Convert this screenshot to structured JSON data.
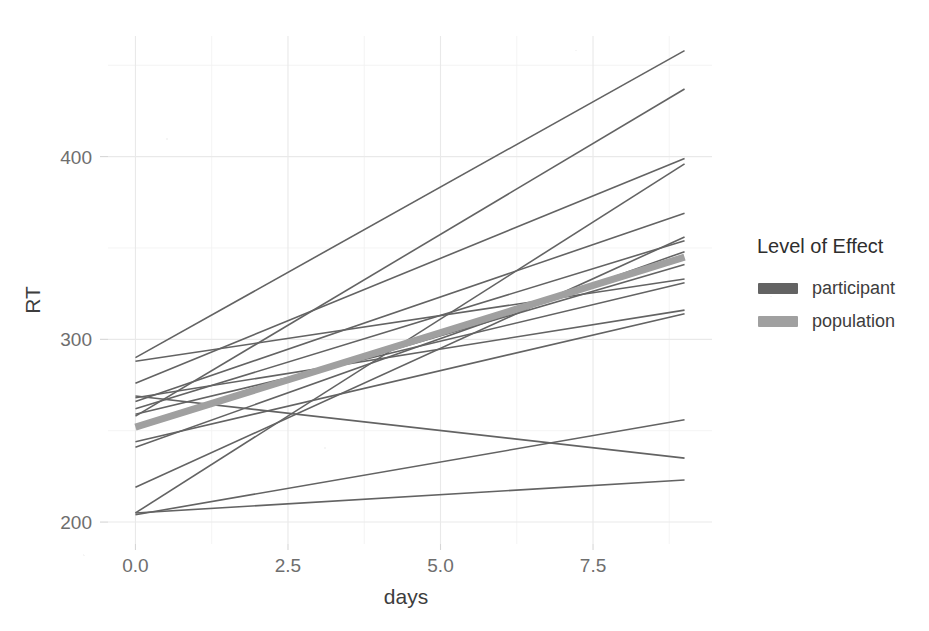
{
  "chart_data": {
    "type": "line",
    "title": "",
    "xlabel": "days",
    "ylabel": "RT",
    "xlim": [
      -0.45,
      9.45
    ],
    "ylim": [
      188,
      466
    ],
    "x_ticks": [
      0.0,
      2.5,
      5.0,
      7.5
    ],
    "x_tick_labels": [
      "0.0",
      "2.5",
      "5.0",
      "7.5"
    ],
    "y_ticks": [
      200,
      300,
      400
    ],
    "y_tick_labels": [
      "200",
      "300",
      "400"
    ],
    "x_minor_ticks": [
      1.25,
      3.75,
      6.25,
      8.75
    ],
    "y_minor_ticks": [
      250,
      350,
      450
    ],
    "grid": true,
    "legend_position": "right",
    "background_color": "#ffffff",
    "grid_color": "#e9e9e9",
    "legend": {
      "title": "Level of Effect",
      "entries": [
        {
          "name": "participant",
          "color": "#636363",
          "linewidth": 1.6
        },
        {
          "name": "population",
          "color": "#a0a0a0",
          "linewidth": 7
        }
      ]
    },
    "series": [
      {
        "name": "participant",
        "level": "participant",
        "color": "#636363",
        "linewidth": 1.6,
        "x": [
          0,
          9
        ],
        "y": [
          290,
          458
        ]
      },
      {
        "name": "participant",
        "level": "participant",
        "color": "#636363",
        "linewidth": 1.6,
        "x": [
          0,
          9
        ],
        "y": [
          258,
          437
        ]
      },
      {
        "name": "participant",
        "level": "participant",
        "color": "#636363",
        "linewidth": 1.6,
        "x": [
          0,
          9
        ],
        "y": [
          276,
          399
        ]
      },
      {
        "name": "participant",
        "level": "participant",
        "color": "#636363",
        "linewidth": 1.6,
        "x": [
          0,
          9
        ],
        "y": [
          205,
          396
        ]
      },
      {
        "name": "participant",
        "level": "participant",
        "color": "#636363",
        "linewidth": 1.6,
        "x": [
          0,
          9
        ],
        "y": [
          266,
          369
        ]
      },
      {
        "name": "participant",
        "level": "participant",
        "color": "#636363",
        "linewidth": 1.6,
        "x": [
          0,
          9
        ],
        "y": [
          219,
          356
        ]
      },
      {
        "name": "participant",
        "level": "participant",
        "color": "#636363",
        "linewidth": 1.6,
        "x": [
          0,
          9
        ],
        "y": [
          262,
          354
        ]
      },
      {
        "name": "participant",
        "level": "participant",
        "color": "#636363",
        "linewidth": 1.6,
        "x": [
          0,
          9
        ],
        "y": [
          241,
          348
        ]
      },
      {
        "name": "participant",
        "level": "participant",
        "color": "#636363",
        "linewidth": 1.6,
        "x": [
          0,
          9
        ],
        "y": [
          253,
          341
        ]
      },
      {
        "name": "participant",
        "level": "participant",
        "color": "#636363",
        "linewidth": 1.6,
        "x": [
          0,
          9
        ],
        "y": [
          288,
          333
        ]
      },
      {
        "name": "participant",
        "level": "participant",
        "color": "#636363",
        "linewidth": 1.6,
        "x": [
          0,
          9
        ],
        "y": [
          259,
          331
        ]
      },
      {
        "name": "participant",
        "level": "participant",
        "color": "#636363",
        "linewidth": 1.6,
        "x": [
          0,
          9
        ],
        "y": [
          268,
          316
        ]
      },
      {
        "name": "participant",
        "level": "participant",
        "color": "#636363",
        "linewidth": 1.6,
        "x": [
          0,
          9
        ],
        "y": [
          244,
          314
        ]
      },
      {
        "name": "participant",
        "level": "participant",
        "color": "#636363",
        "linewidth": 1.6,
        "x": [
          0,
          9
        ],
        "y": [
          204,
          256
        ]
      },
      {
        "name": "participant",
        "level": "participant",
        "color": "#636363",
        "linewidth": 1.6,
        "x": [
          0,
          9
        ],
        "y": [
          269,
          235
        ]
      },
      {
        "name": "participant",
        "level": "participant",
        "color": "#636363",
        "linewidth": 1.6,
        "x": [
          0,
          9
        ],
        "y": [
          205,
          223
        ]
      },
      {
        "name": "population",
        "level": "population",
        "color": "#a0a0a0",
        "linewidth": 7,
        "x": [
          0,
          9
        ],
        "y": [
          252,
          345
        ]
      }
    ]
  },
  "legend": {
    "title": "Level of Effect",
    "items": [
      {
        "label": "participant",
        "swatch_color": "#636363"
      },
      {
        "label": "population",
        "swatch_color": "#a0a0a0"
      }
    ]
  },
  "axes": {
    "x_title": "days",
    "y_title": "RT"
  }
}
